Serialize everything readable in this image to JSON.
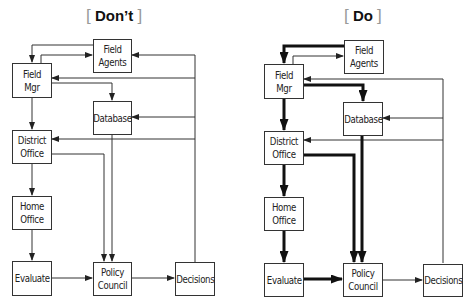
{
  "titles": {
    "left": {
      "text": "Don’t",
      "bracket_open": "[",
      "bracket_close": "]"
    },
    "right": {
      "text": "Do",
      "bracket_open": "[",
      "bracket_close": "]"
    }
  },
  "diagrams": {
    "left": {
      "field_agents": "Field Agents",
      "field_mgr": "Field Mgr",
      "database": "Database",
      "district_office": "District Office",
      "home_office": "Home Office",
      "evaluate": "Evaluate",
      "policy_council": "Policy Council",
      "decisions": "Decisions"
    },
    "right": {
      "field_agents": "Field Agents",
      "field_mgr": "Field Mgr",
      "database": "Database",
      "district_office": "District Office",
      "home_office": "Home Office",
      "evaluate": "Evaluate",
      "policy_council": "Policy Council",
      "decisions": "Decisions"
    }
  },
  "colors": {
    "line": "#333333",
    "thick_line": "#111111",
    "bracket": "#999999"
  }
}
